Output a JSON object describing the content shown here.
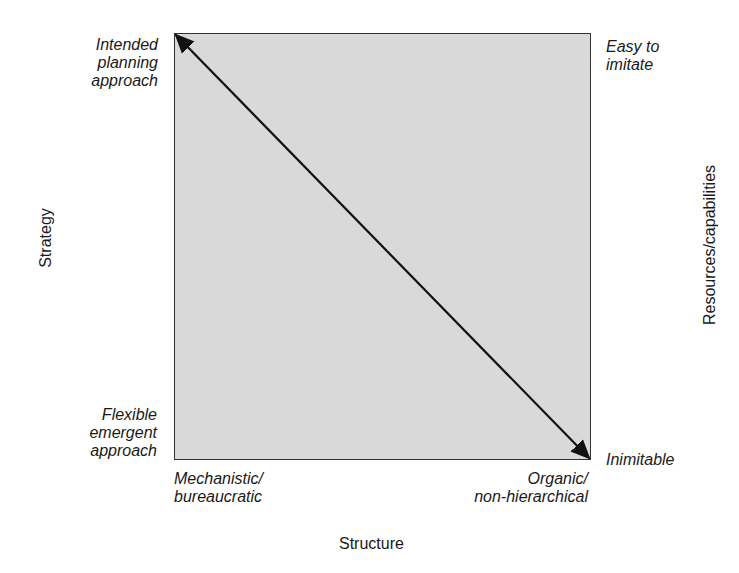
{
  "diagram": {
    "corners": {
      "top_left": [
        "Intended",
        "planning",
        "approach"
      ],
      "bottom_left": [
        "Flexible",
        "emergent",
        "approach"
      ],
      "top_right": [
        "Easy to",
        "imitate"
      ],
      "bottom_right": [
        "Inimitable"
      ],
      "bottom_axis_left": [
        "Mechanistic/",
        "bureaucratic"
      ],
      "bottom_axis_right": [
        "Organic/",
        "non-hierarchical"
      ]
    },
    "axes": {
      "left": "Strategy",
      "right": "Resources/capabilities",
      "bottom": "Structure"
    },
    "arrow": {
      "type": "double-headed",
      "from": "top-left corner",
      "to": "bottom-right corner"
    },
    "colors": {
      "box_fill": "#d9d9d9",
      "border": "#333333",
      "arrow": "#111111"
    }
  }
}
